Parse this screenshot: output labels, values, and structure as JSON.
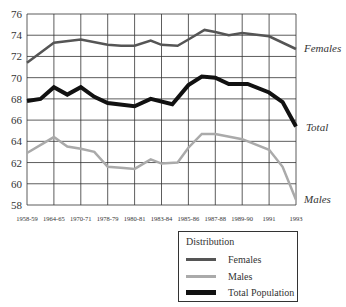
{
  "chart_data": {
    "type": "line",
    "title": "",
    "xlabel": "",
    "ylabel": "",
    "ylim": [
      58,
      76
    ],
    "yticks": [
      58,
      60,
      62,
      64,
      66,
      68,
      70,
      72,
      74,
      76
    ],
    "grid": true,
    "categories": [
      "1958-59",
      "1964-65",
      "1970-71",
      "1978-79",
      "1980-81",
      "1983-84",
      "1985-86",
      "1987-88",
      "1989-90",
      "1991",
      "1993"
    ],
    "series": [
      {
        "name": "Females",
        "color": "#555555",
        "width": 2.5,
        "values": [
          71.4,
          73.3,
          73.6,
          73.1,
          73.0,
          73.1,
          73.8,
          74.3,
          74.2,
          73.9,
          72.7
        ]
      },
      {
        "name": "Males",
        "color": "#aaaaaa",
        "width": 2.5,
        "values": [
          62.9,
          64.4,
          63.4,
          62.0,
          61.4,
          61.9,
          63.2,
          64.7,
          64.2,
          63.3,
          58.5
        ]
      },
      {
        "name": "Total Population",
        "color": "#111111",
        "width": 4,
        "values": [
          67.8,
          69.1,
          69.1,
          67.5,
          67.3,
          67.5,
          69.2,
          70.0,
          69.4,
          68.6,
          65.4
        ]
      }
    ],
    "trace_points": {
      "Females": [
        [
          0,
          71.4
        ],
        [
          1,
          73.3
        ],
        [
          2,
          73.6
        ],
        [
          3,
          73.1
        ],
        [
          3.5,
          73.0
        ],
        [
          4,
          73.0
        ],
        [
          4.6,
          73.5
        ],
        [
          5,
          73.1
        ],
        [
          5.6,
          73.0
        ],
        [
          6,
          73.6
        ],
        [
          6.6,
          74.5
        ],
        [
          7,
          74.3
        ],
        [
          7.5,
          74.0
        ],
        [
          8,
          74.2
        ],
        [
          9,
          73.9
        ],
        [
          10,
          72.7
        ]
      ],
      "Males": [
        [
          0,
          62.9
        ],
        [
          1,
          64.4
        ],
        [
          1.5,
          63.5
        ],
        [
          2,
          63.3
        ],
        [
          2.5,
          63.0
        ],
        [
          3,
          61.6
        ],
        [
          3.6,
          61.5
        ],
        [
          4,
          61.4
        ],
        [
          4.6,
          62.3
        ],
        [
          5,
          61.9
        ],
        [
          5.6,
          62.0
        ],
        [
          6,
          63.4
        ],
        [
          6.5,
          64.7
        ],
        [
          7,
          64.7
        ],
        [
          8,
          64.2
        ],
        [
          9,
          63.2
        ],
        [
          9.5,
          61.6
        ],
        [
          10,
          58.5
        ]
      ],
      "Total Population": [
        [
          0,
          67.8
        ],
        [
          0.5,
          68.0
        ],
        [
          1,
          69.1
        ],
        [
          1.5,
          68.4
        ],
        [
          2,
          69.1
        ],
        [
          2.5,
          68.2
        ],
        [
          3,
          67.6
        ],
        [
          4,
          67.3
        ],
        [
          4.6,
          68.0
        ],
        [
          5.4,
          67.5
        ],
        [
          6,
          69.3
        ],
        [
          6.5,
          70.1
        ],
        [
          7,
          70.0
        ],
        [
          7.5,
          69.4
        ],
        [
          8.2,
          69.4
        ],
        [
          9,
          68.6
        ],
        [
          9.5,
          67.7
        ],
        [
          10,
          65.4
        ]
      ]
    },
    "annotations": [
      {
        "text": "Females",
        "series": "Females"
      },
      {
        "text": "Total",
        "series": "Total Population"
      },
      {
        "text": "Males",
        "series": "Males"
      }
    ],
    "legend": {
      "title": "Distribution",
      "position": "bottom-right",
      "entries": [
        "Females",
        "Males",
        "Total Population"
      ]
    }
  },
  "legend": {
    "title": "Distribution",
    "items": [
      {
        "label": "Females",
        "color": "#555555"
      },
      {
        "label": "Males",
        "color": "#aaaaaa"
      },
      {
        "label": "Total Population",
        "color": "#111111"
      }
    ]
  },
  "labels": {
    "females": "Females",
    "total": "Total",
    "males": "Males"
  }
}
